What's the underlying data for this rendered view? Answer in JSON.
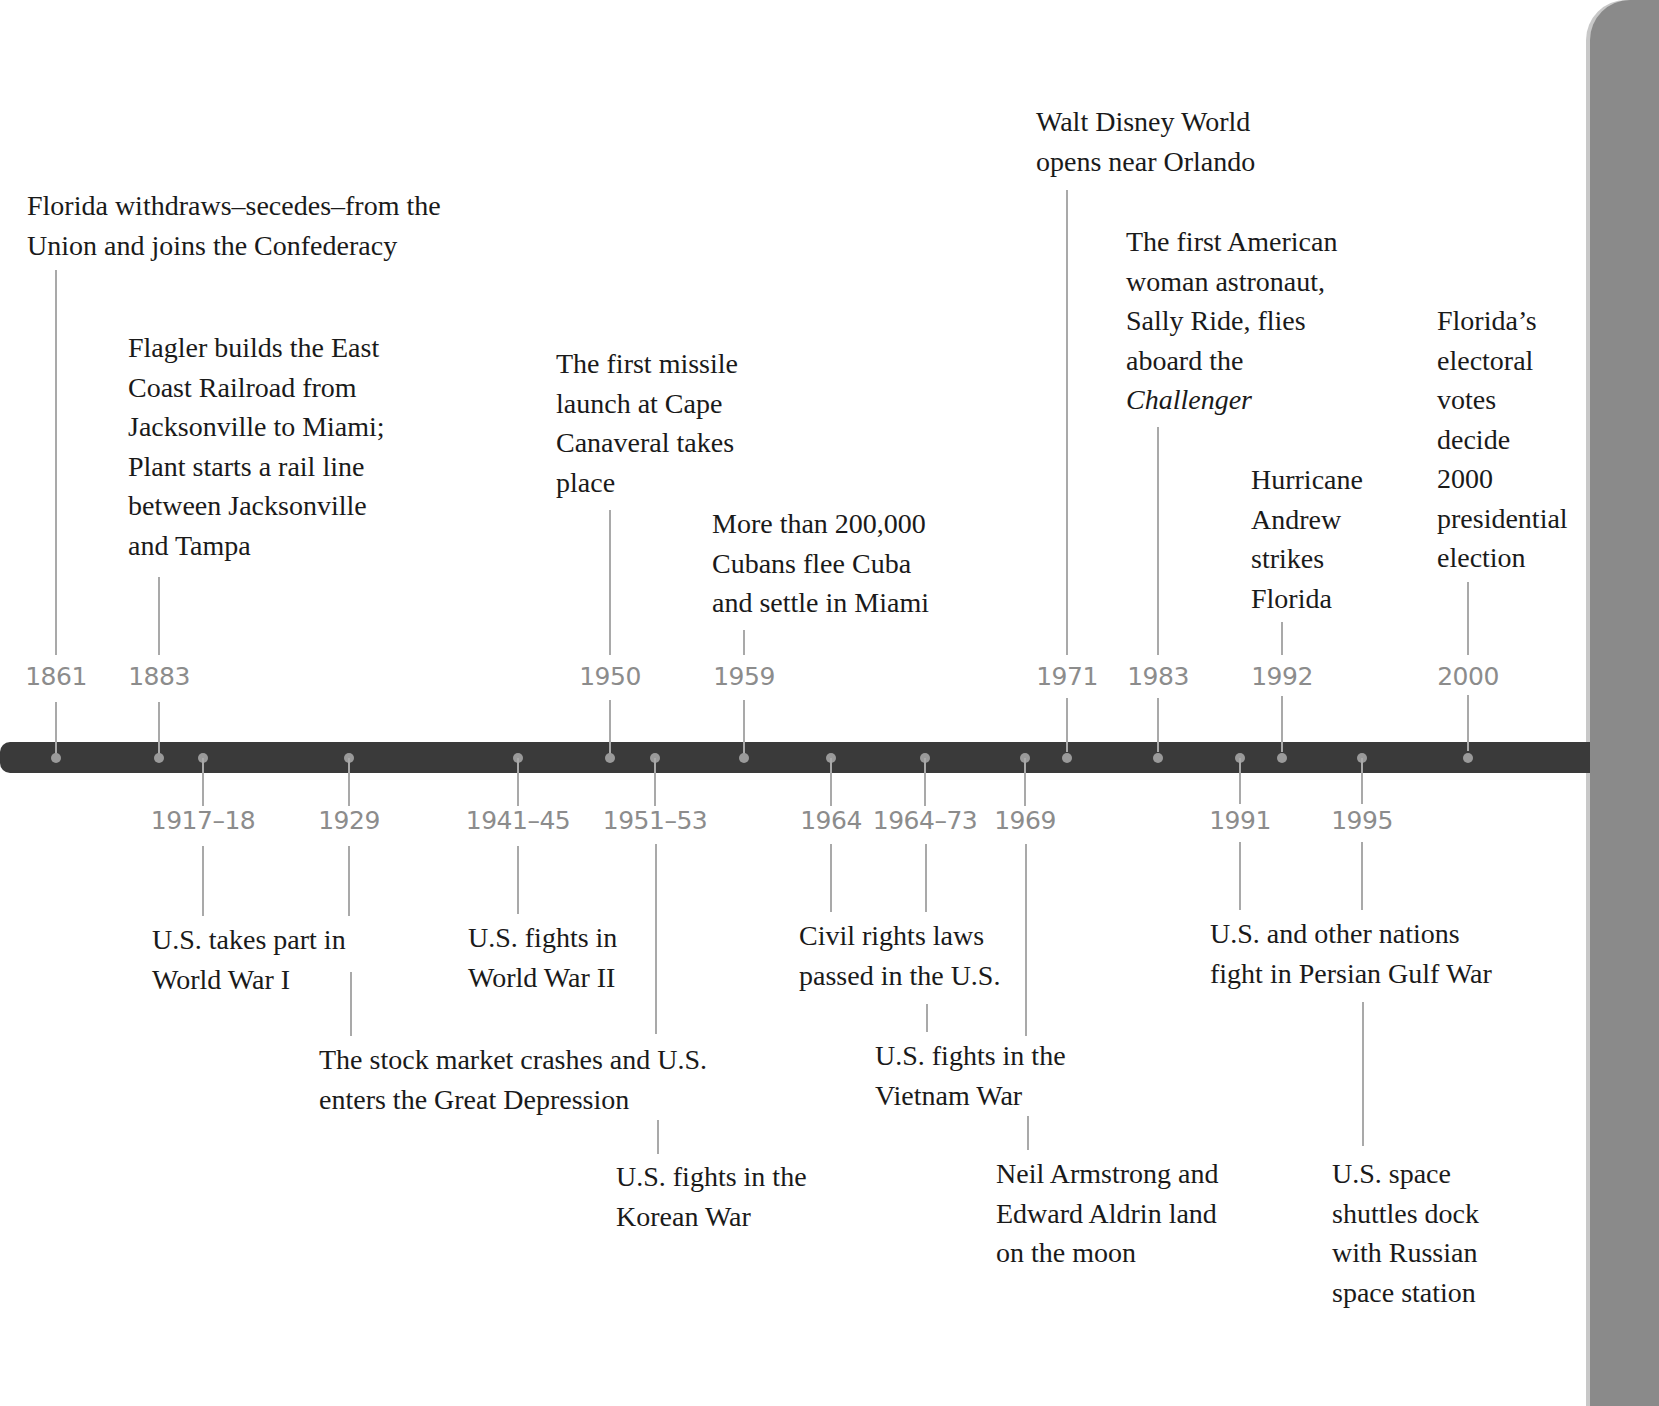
{
  "timeline": {
    "colors": {
      "bar": "#3a3a3a",
      "dot": "#9a9a9a",
      "year_text": "#8c8c8c",
      "connector": "#a9a9a9",
      "side_panel": "#8a8a8a"
    },
    "top_events": [
      {
        "year": "1861",
        "text": "Florida withdraws–secedes–from the\nUnion and joins the Confederacy"
      },
      {
        "year": "1883",
        "text": "Flagler builds the East\nCoast Railroad from\nJacksonville to Miami;\nPlant starts a rail line\nbetween Jacksonville\nand Tampa"
      },
      {
        "year": "1950",
        "text": "The first missile\nlaunch at Cape\nCanaveral takes\nplace"
      },
      {
        "year": "1959",
        "text": "More than 200,000\nCubans flee Cuba\nand settle in Miami"
      },
      {
        "year": "1971",
        "text": "Walt Disney World\nopens near Orlando"
      },
      {
        "year": "1983",
        "text": "The first American\nwoman astronaut,\nSally Ride, flies\naboard the",
        "italic_text": "Challenger"
      },
      {
        "year": "1992",
        "text": "Hurricane\nAndrew\nstrikes\nFlorida"
      },
      {
        "year": "2000",
        "text": "Florida’s\nelectoral\nvotes\ndecide\n2000\npresidential\nelection"
      }
    ],
    "bottom_events": [
      {
        "year": "1917–18",
        "text": "U.S. takes part in\nWorld War I"
      },
      {
        "year": "1929",
        "text": "The stock market crashes and U.S.\nenters the Great Depression"
      },
      {
        "year": "1941–45",
        "text": "U.S. fights in\nWorld War II"
      },
      {
        "year": "1951–53",
        "text": "U.S. fights in the\nKorean War"
      },
      {
        "year": "1964",
        "text": "Civil rights laws\npassed in the U.S."
      },
      {
        "year": "1964–73",
        "text": "U.S. fights in the\nVietnam War"
      },
      {
        "year": "1969",
        "text": "Neil Armstrong and\nEdward Aldrin land\non the moon"
      },
      {
        "year": "1991",
        "text": "U.S. and other nations\nfight in Persian Gulf War"
      },
      {
        "year": "1995",
        "text": "U.S. space\nshuttles dock\nwith Russian\nspace station"
      }
    ]
  }
}
